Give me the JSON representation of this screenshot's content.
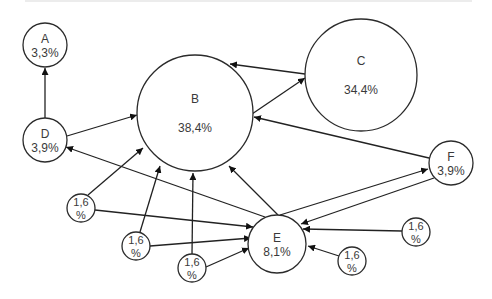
{
  "diagram": {
    "type": "directed-graph",
    "nodes": [
      {
        "id": "A",
        "label": "A",
        "value": "3,3%",
        "cx": 45,
        "cy": 45,
        "r": 22
      },
      {
        "id": "B",
        "label": "B",
        "value": "38,4%",
        "cx": 195,
        "cy": 113,
        "r": 58
      },
      {
        "id": "C",
        "label": "C",
        "value": "34,4%",
        "cx": 361,
        "cy": 75,
        "r": 56
      },
      {
        "id": "D",
        "label": "D",
        "value": "3,9%",
        "cx": 45,
        "cy": 140,
        "r": 22
      },
      {
        "id": "E",
        "label": "E",
        "value": "8,1%",
        "cx": 277,
        "cy": 244,
        "r": 29
      },
      {
        "id": "F",
        "label": "F",
        "value": "3,9%",
        "cx": 451,
        "cy": 163,
        "r": 22
      },
      {
        "id": "S1",
        "label": "1,6",
        "value": "%",
        "cx": 81,
        "cy": 208,
        "r": 14
      },
      {
        "id": "S2",
        "label": "1,6",
        "value": "%",
        "cx": 136,
        "cy": 246,
        "r": 14
      },
      {
        "id": "S3",
        "label": "1,6",
        "value": "%",
        "cx": 192,
        "cy": 268,
        "r": 14
      },
      {
        "id": "S4",
        "label": "1,6",
        "value": "%",
        "cx": 416,
        "cy": 232,
        "r": 14
      },
      {
        "id": "S5",
        "label": "1,6",
        "value": "%",
        "cx": 352,
        "cy": 261,
        "r": 14
      }
    ],
    "edges": [
      {
        "from": "D",
        "to": "A",
        "x1": 45,
        "y1": 118,
        "x2": 45,
        "y2": 68
      },
      {
        "from": "D",
        "to": "B",
        "x1": 67,
        "y1": 136,
        "x2": 137,
        "y2": 115
      },
      {
        "from": "C",
        "to": "B",
        "x1": 305,
        "y1": 74,
        "x2": 230,
        "y2": 64
      },
      {
        "from": "B",
        "to": "C",
        "x1": 252,
        "y1": 114,
        "x2": 305,
        "y2": 78
      },
      {
        "from": "F",
        "to": "B",
        "x1": 429,
        "y1": 158,
        "x2": 254,
        "y2": 117
      },
      {
        "from": "E",
        "to": "D",
        "x1": 265,
        "y1": 217,
        "x2": 66,
        "y2": 147
      },
      {
        "from": "E",
        "to": "B",
        "x1": 278,
        "y1": 215,
        "x2": 229,
        "y2": 166
      },
      {
        "from": "E",
        "to": "F",
        "x1": 280,
        "y1": 215,
        "x2": 428,
        "y2": 169
      },
      {
        "from": "F",
        "to": "E",
        "x1": 434,
        "y1": 178,
        "x2": 301,
        "y2": 224
      },
      {
        "from": "S1",
        "to": "B",
        "x1": 88,
        "y1": 195,
        "x2": 143,
        "y2": 148
      },
      {
        "from": "S1",
        "to": "E",
        "x1": 95,
        "y1": 210,
        "x2": 253,
        "y2": 227
      },
      {
        "from": "S2",
        "to": "B",
        "x1": 140,
        "y1": 232,
        "x2": 160,
        "y2": 166
      },
      {
        "from": "S2",
        "to": "E",
        "x1": 150,
        "y1": 246,
        "x2": 251,
        "y2": 238
      },
      {
        "from": "S3",
        "to": "B",
        "x1": 192,
        "y1": 254,
        "x2": 193,
        "y2": 173
      },
      {
        "from": "S3",
        "to": "E",
        "x1": 206,
        "y1": 267,
        "x2": 249,
        "y2": 248
      },
      {
        "from": "S4",
        "to": "E",
        "x1": 402,
        "y1": 231,
        "x2": 303,
        "y2": 229
      },
      {
        "from": "S5",
        "to": "E",
        "x1": 339,
        "y1": 256,
        "x2": 308,
        "y2": 246
      }
    ]
  }
}
